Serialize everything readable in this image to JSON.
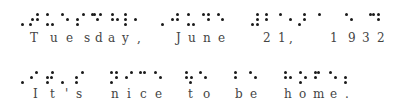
{
  "lines": [
    {
      "text": "Tuesday, June 21, 1932",
      "chars": [
        {
          "c": "T",
          "x": 30
        },
        {
          "c": "u",
          "x": 50
        },
        {
          "c": "e",
          "x": 66
        },
        {
          "c": "s",
          "x": 84
        },
        {
          "c": "d",
          "x": 95
        },
        {
          "c": "a",
          "x": 108
        },
        {
          "c": "y",
          "x": 122
        },
        {
          "c": ",",
          "x": 137
        },
        {
          "c": "J",
          "x": 176
        },
        {
          "c": "u",
          "x": 188
        },
        {
          "c": "n",
          "x": 203
        },
        {
          "c": "e",
          "x": 218
        },
        {
          "c": "2",
          "x": 263
        },
        {
          "c": "1",
          "x": 278
        },
        {
          "c": ",",
          "x": 289
        },
        {
          "c": "1",
          "x": 330
        },
        {
          "c": "9",
          "x": 348
        },
        {
          "c": "3",
          "x": 362
        },
        {
          "c": "2",
          "x": 377
        }
      ],
      "dots": [
        [
          22,
          24
        ],
        [
          30,
          24
        ],
        [
          32,
          19
        ],
        [
          37,
          14
        ],
        [
          37,
          19
        ],
        [
          47,
          14
        ],
        [
          47,
          24
        ],
        [
          52,
          24
        ],
        [
          62,
          14
        ],
        [
          67,
          19
        ],
        [
          77,
          19
        ],
        [
          77,
          24
        ],
        [
          83,
          14
        ],
        [
          92,
          14
        ],
        [
          94,
          14
        ],
        [
          97,
          19
        ],
        [
          100,
          14
        ],
        [
          112,
          14
        ],
        [
          112,
          19
        ],
        [
          117,
          19
        ],
        [
          125,
          19
        ],
        [
          125,
          24
        ],
        [
          125,
          14
        ],
        [
          135,
          19
        ],
        [
          162,
          24
        ],
        [
          172,
          19
        ],
        [
          177,
          14
        ],
        [
          177,
          19
        ],
        [
          188,
          14
        ],
        [
          188,
          24
        ],
        [
          193,
          24
        ],
        [
          203,
          14
        ],
        [
          208,
          14
        ],
        [
          208,
          19
        ],
        [
          218,
          14
        ],
        [
          222,
          19
        ],
        [
          252,
          24
        ],
        [
          257,
          24
        ],
        [
          257,
          19
        ],
        [
          257,
          14
        ],
        [
          266,
          14
        ],
        [
          266,
          19
        ],
        [
          280,
          14
        ],
        [
          290,
          19
        ],
        [
          299,
          24
        ],
        [
          304,
          19
        ],
        [
          304,
          14
        ],
        [
          319,
          14
        ],
        [
          346,
          14
        ],
        [
          351,
          19
        ],
        [
          370,
          14
        ],
        [
          373,
          14
        ],
        [
          378,
          14
        ],
        [
          378,
          19
        ]
      ]
    },
    {
      "text": "It's nice to be home.",
      "chars": [
        {
          "c": "I",
          "x": 33
        },
        {
          "c": "t",
          "x": 50
        },
        {
          "c": "'",
          "x": 65
        },
        {
          "c": "s",
          "x": 76
        },
        {
          "c": "n",
          "x": 111
        },
        {
          "c": "i",
          "x": 127
        },
        {
          "c": "c",
          "x": 140
        },
        {
          "c": "e",
          "x": 155
        },
        {
          "c": "t",
          "x": 188
        },
        {
          "c": "o",
          "x": 203
        },
        {
          "c": "b",
          "x": 235
        },
        {
          "c": "e",
          "x": 250
        },
        {
          "c": "h",
          "x": 284
        },
        {
          "c": "o",
          "x": 299
        },
        {
          "c": "m",
          "x": 313
        },
        {
          "c": "e",
          "x": 330
        },
        {
          "c": ".",
          "x": 345
        }
      ],
      "dots": [
        [
          22,
          82
        ],
        [
          31,
          77
        ],
        [
          36,
          72
        ],
        [
          47,
          77
        ],
        [
          47,
          82
        ],
        [
          51,
          77
        ],
        [
          52,
          72
        ],
        [
          62,
          82
        ],
        [
          76,
          77
        ],
        [
          76,
          82
        ],
        [
          82,
          72
        ],
        [
          111,
          72
        ],
        [
          111,
          82
        ],
        [
          116,
          72
        ],
        [
          116,
          77
        ],
        [
          126,
          77
        ],
        [
          131,
          72
        ],
        [
          140,
          72
        ],
        [
          144,
          72
        ],
        [
          155,
          72
        ],
        [
          160,
          77
        ],
        [
          186,
          72
        ],
        [
          186,
          77
        ],
        [
          191,
          77
        ],
        [
          190,
          82
        ],
        [
          200,
          72
        ],
        [
          205,
          77
        ],
        [
          235,
          72
        ],
        [
          235,
          77
        ],
        [
          250,
          72
        ],
        [
          255,
          77
        ],
        [
          285,
          72
        ],
        [
          285,
          77
        ],
        [
          290,
          77
        ],
        [
          300,
          72
        ],
        [
          305,
          77
        ],
        [
          300,
          82
        ],
        [
          315,
          72
        ],
        [
          318,
          72
        ],
        [
          315,
          77
        ],
        [
          330,
          72
        ],
        [
          335,
          77
        ],
        [
          345,
          77
        ],
        [
          345,
          82
        ]
      ]
    }
  ],
  "colors": {
    "dot": "#1a1a1a",
    "text": "#444444",
    "background": "#ffffff"
  }
}
